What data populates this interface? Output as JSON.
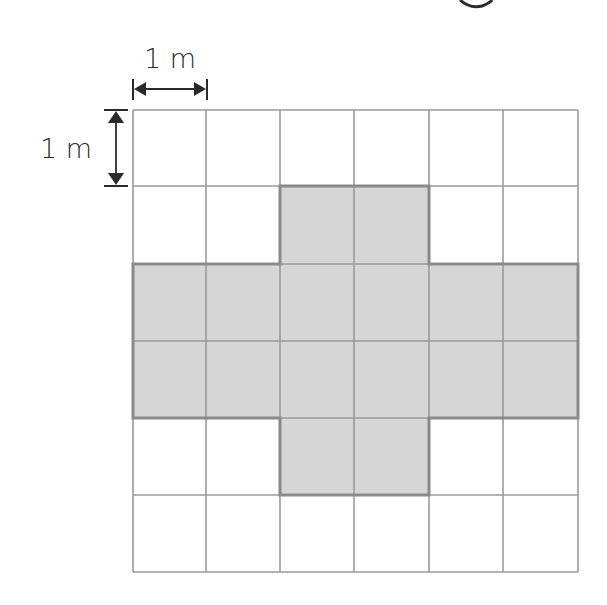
{
  "diagram": {
    "grid": {
      "rows": 6,
      "cols": 6,
      "x_lines": [
        133,
        206,
        280,
        354,
        429,
        503,
        578
      ],
      "y_lines": [
        110,
        186,
        264,
        341,
        418,
        495,
        572
      ],
      "line_color": "#9a9a9a",
      "shaded_fill": "#d6d6d6",
      "shaded_outline": "#8a8a8a",
      "shaded_cells": [
        [
          1,
          2
        ],
        [
          1,
          3
        ],
        [
          2,
          0
        ],
        [
          2,
          1
        ],
        [
          2,
          2
        ],
        [
          2,
          3
        ],
        [
          2,
          4
        ],
        [
          2,
          5
        ],
        [
          3,
          0
        ],
        [
          3,
          1
        ],
        [
          3,
          2
        ],
        [
          3,
          3
        ],
        [
          3,
          4
        ],
        [
          3,
          5
        ],
        [
          4,
          2
        ],
        [
          4,
          3
        ]
      ],
      "shape": "plus / cross",
      "shaded_area_m2": 16
    },
    "dimensions": {
      "horizontal": {
        "label": "1 m",
        "span": "one grid square width"
      },
      "vertical": {
        "label": "1 m",
        "span": "one grid square height"
      }
    },
    "top_cutoff_glyph": "g"
  }
}
